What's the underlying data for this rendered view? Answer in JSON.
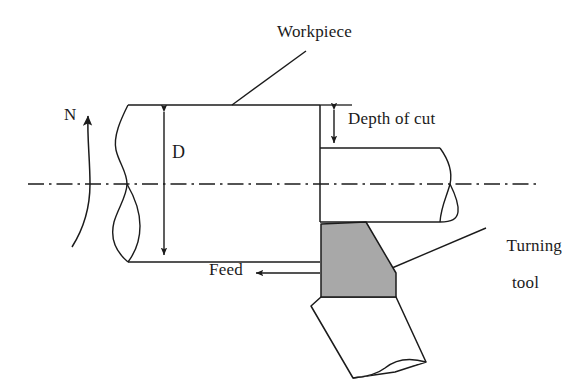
{
  "figure": {
    "type": "engineering-diagram",
    "background_color": "#ffffff",
    "line_color": "#1b1b1b",
    "insert_fill_color": "#a8a8a8",
    "shank_fill_color": "#ffffff"
  },
  "labels": {
    "workpiece": "Workpiece",
    "rotation_speed": "N",
    "diameter": "D",
    "depth_of_cut": "Depth of cut",
    "feed": "Feed",
    "turning_tool_line1": "Turning",
    "turning_tool_line2": "tool"
  },
  "annotations": {
    "rotation_arrow": "curved arrow indicating spindle rotation N",
    "diameter_dimension": "double-headed vertical arrow spanning workpiece diameter D",
    "depth_of_cut_dimension": "double-headed vertical arrow between uncut and cut surface",
    "feed_arrow": "horizontal arrow pointing left indicating feed direction",
    "workpiece_leader": "leader line from Workpiece text to bar top surface",
    "turning_tool_leader": "leader line from Turning tool text to cutting insert",
    "centerline": "horizontal dash-dot axis of rotation",
    "break_lines": "S-shaped break symbols on bar left end and right end"
  },
  "geometry": {
    "centerline_y": 184,
    "bar_top_y": 105,
    "bar_bottom_y": 262,
    "cut_top_y": 222,
    "cut_bottom_y": 148,
    "step_x": 320,
    "bar_left_x": 118,
    "bar_right_x": 500
  }
}
